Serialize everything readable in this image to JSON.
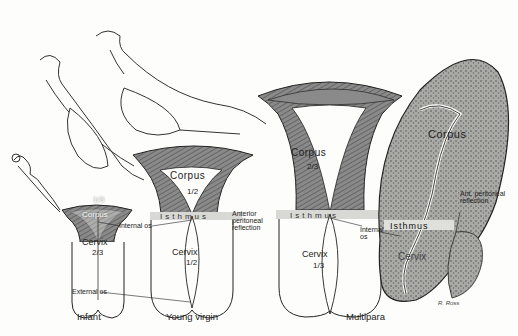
{
  "stages": [
    {
      "caption": "Infant",
      "corpus_label": "Corpus",
      "corpus_fraction": "1/3",
      "cervix_label": "Cervix",
      "cervix_fraction": "2/3"
    },
    {
      "caption": "Young virgin",
      "corpus_label": "Corpus",
      "corpus_fraction": "1/2",
      "isthmus_label": "Isthmus",
      "cervix_label": "Cervix",
      "cervix_fraction": "1/2"
    },
    {
      "caption": "Multipara",
      "corpus_label": "Corpus",
      "corpus_fraction": "2/3",
      "isthmus_label": "Isthmus",
      "cervix_label": "Cervix",
      "cervix_fraction": "1/3"
    },
    {
      "caption": "",
      "corpus_label": "Corpus",
      "isthmus_label": "Isthmus",
      "cervix_label": "Cervix",
      "peritoneal_label": "Ant. peritoneal reflection"
    }
  ],
  "annotations": {
    "internal_os": "Internal os",
    "external_os": "External os",
    "anterior_peritoneal_reflection": "Anterior peritoneal reflection",
    "internal_os_multipara": "Internal os"
  },
  "signature": "R. Ross",
  "colors": {
    "background": "#fdfdfb",
    "shading": "#7a7a7a",
    "line": "#222222",
    "isthmus_band": "#d8d8d4"
  }
}
